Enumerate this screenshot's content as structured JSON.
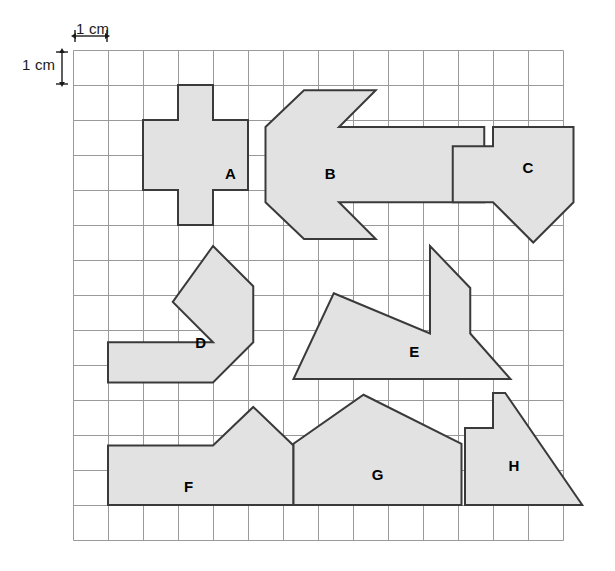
{
  "page": {
    "background": "#ffffff",
    "grid": {
      "origin_x": 73,
      "origin_y": 50,
      "cell_px": 35,
      "cols": 14,
      "rows": 14,
      "line_color": "#9a9a9a",
      "line_width": 1
    },
    "shape_style": {
      "fill": "#e2e2e2",
      "stroke": "#3a3a3a",
      "stroke_width": 2
    }
  },
  "dimensions": {
    "horizontal": {
      "label": "1 cm",
      "units": "cm",
      "value": 1,
      "arrow_color": "#1a1a1a"
    },
    "vertical": {
      "label": "1 cm",
      "units": "cm",
      "value": 1,
      "arrow_color": "#1a1a1a"
    }
  },
  "shapes": [
    {
      "id": "A",
      "label": "A",
      "label_pos": [
        4.5,
        3.5
      ],
      "points_cells": [
        [
          3,
          1
        ],
        [
          4,
          1
        ],
        [
          4,
          2
        ],
        [
          5,
          2
        ],
        [
          5,
          4
        ],
        [
          4,
          4
        ],
        [
          4,
          5
        ],
        [
          3,
          5
        ],
        [
          3,
          4
        ],
        [
          2,
          4
        ],
        [
          2,
          2
        ],
        [
          3,
          2
        ]
      ]
    },
    {
      "id": "B",
      "label": "B",
      "label_pos": [
        7.35,
        3.5
      ],
      "points_cells": [
        [
          6.6,
          1.15
        ],
        [
          8.65,
          1.15
        ],
        [
          7.6,
          2.2
        ],
        [
          11.75,
          2.2
        ],
        [
          11.75,
          4.35
        ],
        [
          7.6,
          4.35
        ],
        [
          8.65,
          5.4
        ],
        [
          6.6,
          5.4
        ],
        [
          5.5,
          4.35
        ],
        [
          5.5,
          2.2
        ]
      ]
    },
    {
      "id": "C",
      "label": "C",
      "label_pos": [
        13.0,
        3.35
      ],
      "points_cells": [
        [
          12.0,
          2.2
        ],
        [
          14.3,
          2.2
        ],
        [
          14.3,
          4.35
        ],
        [
          13.15,
          5.5
        ],
        [
          12.0,
          4.35
        ],
        [
          10.85,
          4.35
        ],
        [
          10.85,
          2.75
        ],
        [
          12.0,
          2.75
        ]
      ]
    },
    {
      "id": "D",
      "label": "D",
      "label_pos": [
        3.65,
        8.35
      ],
      "points_cells": [
        [
          4.0,
          5.6
        ],
        [
          5.15,
          6.75
        ],
        [
          5.15,
          8.35
        ],
        [
          4.0,
          9.5
        ],
        [
          1.0,
          9.5
        ],
        [
          1.0,
          8.35
        ],
        [
          4.0,
          8.35
        ],
        [
          2.85,
          7.2
        ]
      ]
    },
    {
      "id": "E",
      "label": "E",
      "label_pos": [
        9.75,
        8.6
      ],
      "points_cells": [
        [
          7.45,
          6.95
        ],
        [
          10.2,
          8.1
        ],
        [
          10.2,
          5.6
        ],
        [
          11.35,
          6.8
        ],
        [
          11.35,
          8.1
        ],
        [
          12.5,
          9.4
        ],
        [
          6.3,
          9.4
        ]
      ]
    },
    {
      "id": "F",
      "label": "F",
      "label_pos": [
        3.3,
        12.45
      ],
      "points_cells": [
        [
          1.0,
          11.3
        ],
        [
          4.0,
          11.3
        ],
        [
          5.15,
          10.2
        ],
        [
          6.3,
          11.3
        ],
        [
          6.3,
          13.0
        ],
        [
          1.0,
          13.0
        ]
      ]
    },
    {
      "id": "G",
      "label": "G",
      "label_pos": [
        8.7,
        12.1
      ],
      "points_cells": [
        [
          8.3,
          9.85
        ],
        [
          11.1,
          11.25
        ],
        [
          11.1,
          13.0
        ],
        [
          6.3,
          13.0
        ],
        [
          6.3,
          11.25
        ]
      ]
    },
    {
      "id": "H",
      "label": "H",
      "label_pos": [
        12.6,
        11.85
      ],
      "points_cells": [
        [
          12.35,
          9.8
        ],
        [
          14.55,
          13.0
        ],
        [
          11.2,
          13.0
        ],
        [
          11.2,
          10.8
        ],
        [
          12.0,
          10.8
        ],
        [
          12.0,
          9.8
        ]
      ]
    }
  ]
}
